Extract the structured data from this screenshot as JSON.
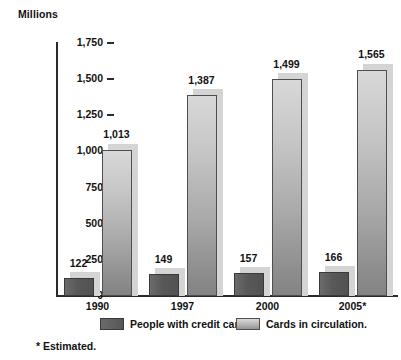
{
  "chart_data": {
    "type": "bar",
    "title": "",
    "ylabel": "Millions",
    "xlabel": "",
    "ylim": [
      0,
      1750
    ],
    "ytick_labels": [
      "0",
      "250",
      "500",
      "750",
      "1,000",
      "1,250",
      "1,500",
      "1,750"
    ],
    "ytick_values": [
      0,
      250,
      500,
      750,
      1000,
      1250,
      1500,
      1750
    ],
    "grid": false,
    "legend_position": "bottom",
    "categories": [
      "1990",
      "1997",
      "2000",
      "2005*"
    ],
    "series": [
      {
        "name": "People with credit cards.",
        "color": "#585858",
        "values": [
          122,
          149,
          157,
          166
        ],
        "value_labels": [
          "122",
          "149",
          "157",
          "166"
        ]
      },
      {
        "name": "Cards in circulation.",
        "color": "#b8b8b8",
        "values": [
          1013,
          1387,
          1499,
          1565
        ],
        "value_labels": [
          "1,013",
          "1,387",
          "1,499",
          "1,565"
        ]
      }
    ],
    "annotations": [
      "* Estimated."
    ]
  },
  "axis": {
    "y_title": "Millions"
  },
  "legend": {
    "items": [
      {
        "label": "People with credit cards."
      },
      {
        "label": "Cards in circulation."
      }
    ]
  },
  "footnote": {
    "text": "* Estimated."
  }
}
